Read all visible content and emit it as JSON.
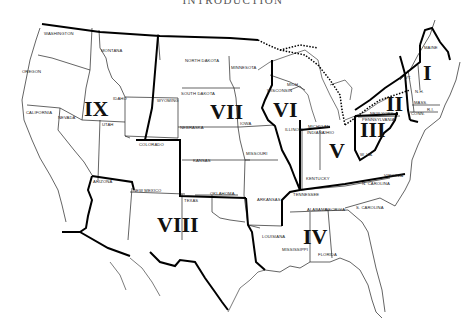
{
  "page": {
    "title": "INTRODUCTION"
  },
  "map": {
    "description": "Map of the continental United States divided into nine numbered regions",
    "colors": {
      "ink": "#111111",
      "background": "#ffffff"
    },
    "regions": [
      {
        "numeral": "I",
        "x": 430,
        "y": 73
      },
      {
        "numeral": "II",
        "x": 396,
        "y": 106
      },
      {
        "numeral": "III",
        "x": 373,
        "y": 132
      },
      {
        "numeral": "IV",
        "x": 316,
        "y": 238
      },
      {
        "numeral": "V",
        "x": 336,
        "y": 153
      },
      {
        "numeral": "VI",
        "x": 286,
        "y": 113
      },
      {
        "numeral": "VII",
        "x": 226,
        "y": 114
      },
      {
        "numeral": "VIII",
        "x": 186,
        "y": 228
      },
      {
        "numeral": "IX",
        "x": 96,
        "y": 111
      }
    ],
    "states": [
      {
        "name": "WASHINGTON",
        "x": 44,
        "y": 34
      },
      {
        "name": "MONTANA",
        "x": 101,
        "y": 51
      },
      {
        "name": "OREGON",
        "x": 29,
        "y": 72
      },
      {
        "name": "IDAHO",
        "x": 117,
        "y": 99
      },
      {
        "name": "WYOMING",
        "x": 157,
        "y": 101
      },
      {
        "name": "CALIFORNIA",
        "x": 28,
        "y": 113
      },
      {
        "name": "NEVADA",
        "x": 58,
        "y": 118
      },
      {
        "name": "UTAH",
        "x": 103,
        "y": 125
      },
      {
        "name": "COLORADO",
        "x": 139,
        "y": 145
      },
      {
        "name": "ARIZONA",
        "x": 93,
        "y": 182
      },
      {
        "name": "NEW MEXICO",
        "x": 134,
        "y": 191
      },
      {
        "name": "NORTH DAKOTA",
        "x": 184,
        "y": 61
      },
      {
        "name": "SOUTH DAKOTA",
        "x": 181,
        "y": 94
      },
      {
        "name": "MINNESOTA",
        "x": 231,
        "y": 68
      },
      {
        "name": "NEBRASKA",
        "x": 180,
        "y": 128
      },
      {
        "name": "IOWA",
        "x": 240,
        "y": 124
      },
      {
        "name": "KANSAS",
        "x": 194,
        "y": 161
      },
      {
        "name": "MISSOURI",
        "x": 250,
        "y": 154
      },
      {
        "name": "OKLAHOMA",
        "x": 213,
        "y": 194
      },
      {
        "name": "TEXAS",
        "x": 187,
        "y": 201
      },
      {
        "name": "ARKANSAS",
        "x": 262,
        "y": 200
      },
      {
        "name": "LOUISIANA",
        "x": 267,
        "y": 237
      },
      {
        "name": "WISCONSIN",
        "x": 276,
        "y": 91
      },
      {
        "name": "MICH.",
        "x": 291,
        "y": 85
      },
      {
        "name": "ILLINOIS",
        "x": 286,
        "y": 130
      },
      {
        "name": "MICHIGAN",
        "x": 321,
        "y": 127
      },
      {
        "name": "INDIANA",
        "x": 314,
        "y": 133
      },
      {
        "name": "OHIO",
        "x": 330,
        "y": 133
      },
      {
        "name": "KENTUCKY",
        "x": 318,
        "y": 179
      },
      {
        "name": "TENNESSEE",
        "x": 297,
        "y": 195
      },
      {
        "name": "W. VA.",
        "x": 364,
        "y": 155
      },
      {
        "name": "VIRGINIA",
        "x": 393,
        "y": 176
      },
      {
        "name": "N. CAROLINA",
        "x": 372,
        "y": 184
      },
      {
        "name": "S. CAROLINA",
        "x": 368,
        "y": 208
      },
      {
        "name": "ALABAMA",
        "x": 312,
        "y": 210
      },
      {
        "name": "GEORGIA",
        "x": 331,
        "y": 210
      },
      {
        "name": "MISSISSIPPI",
        "x": 290,
        "y": 250
      },
      {
        "name": "FLORIDA",
        "x": 325,
        "y": 255
      },
      {
        "name": "NEW YORK",
        "x": 376,
        "y": 114
      },
      {
        "name": "PENNSYLVANIA",
        "x": 373,
        "y": 120
      },
      {
        "name": "VT.",
        "x": 408,
        "y": 78
      },
      {
        "name": "N.H.",
        "x": 418,
        "y": 92
      },
      {
        "name": "MASS.",
        "x": 418,
        "y": 105
      },
      {
        "name": "CONN.",
        "x": 416,
        "y": 114
      },
      {
        "name": "R.I.",
        "x": 430,
        "y": 110
      },
      {
        "name": "MAINE",
        "x": 430,
        "y": 48
      }
    ]
  }
}
